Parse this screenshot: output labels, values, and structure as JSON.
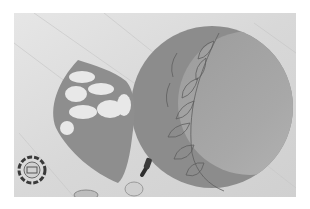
{
  "image": {
    "description": "Grayscale photo of a round gray fondant disc decorated with a leaf garland along its left crescent, a leaf-shaped fondant piece with white cutouts, and cookie cutters on a marble surface",
    "colors": {
      "frame": "#ffffff",
      "marble": "#dcdcdc",
      "disc_outer": "#8c8c8c",
      "disc_inner": "#a3a3a3",
      "leaf_piece": "#8e8e8e",
      "cutout": "#e8e8e8",
      "cutter_dark": "#3a3a3a"
    },
    "objects": [
      {
        "name": "fondant-disc",
        "label": "Round fondant disc with leaf garland"
      },
      {
        "name": "leaf-piece",
        "label": "Leaf-shaped fondant with cut-out holes"
      },
      {
        "name": "flower-cutter",
        "label": "Flower cookie cutter"
      },
      {
        "name": "tool-handle",
        "label": "Dark tool handle"
      }
    ]
  }
}
